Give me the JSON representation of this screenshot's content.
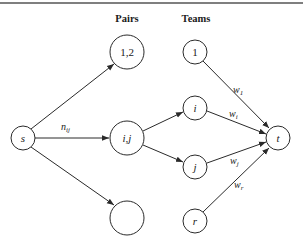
{
  "headers": {
    "pairs": "Pairs",
    "teams": "Teams"
  },
  "nodes": {
    "source": "s",
    "sink": "t",
    "pair_1_2": "1,2",
    "pair_i_j": "i,j",
    "pair_empty": "",
    "team_1": "1",
    "team_i": "i",
    "team_j": "j",
    "team_r": "r"
  },
  "edges": {
    "s_to_pair": {
      "label": "n",
      "sub": "ij"
    },
    "team1_to_t": {
      "label": "w",
      "sub": "1"
    },
    "teami_to_t": {
      "label": "w",
      "sub": "i"
    },
    "teamj_to_t": {
      "label": "w",
      "sub": "j"
    },
    "teamr_to_t": {
      "label": "w",
      "sub": "r"
    }
  },
  "colors": {
    "stroke": "#2a2a2a",
    "background": "#ffffff"
  }
}
